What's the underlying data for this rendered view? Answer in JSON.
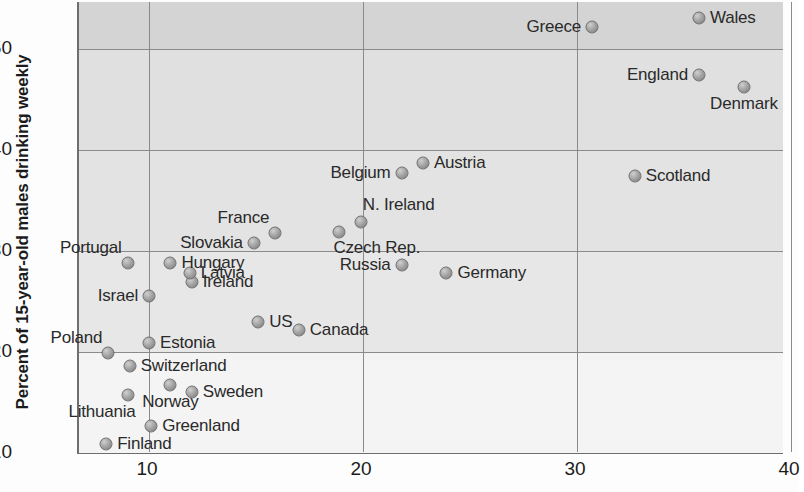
{
  "chart_data": {
    "type": "scatter",
    "title": "",
    "xlabel": "",
    "ylabel": "Percent of 15-year-old males drinking weekly",
    "xlim": [
      7,
      40
    ],
    "ylim": [
      10,
      55
    ],
    "xticks": [
      10,
      20,
      30,
      40
    ],
    "yticks": [
      10,
      20,
      30,
      40,
      50
    ],
    "grid": true,
    "legend": "none",
    "marker_color": "#9a9a9a",
    "marker_edge_color": "#6b6b6b",
    "points": [
      {
        "label": "Finland",
        "x": 8.0,
        "y": 10.9,
        "pos": "r"
      },
      {
        "label": "Greenland",
        "x": 10.1,
        "y": 12.7,
        "pos": "r"
      },
      {
        "label": "Lithuania",
        "x": 9.0,
        "y": 15.7,
        "pos": "bl"
      },
      {
        "label": "Norway",
        "x": 11.0,
        "y": 16.7,
        "pos": "b"
      },
      {
        "label": "Sweden",
        "x": 12.0,
        "y": 16.0,
        "pos": "r"
      },
      {
        "label": "Switzerland",
        "x": 9.1,
        "y": 18.6,
        "pos": "r"
      },
      {
        "label": "Poland",
        "x": 8.1,
        "y": 19.9,
        "pos": "tl"
      },
      {
        "label": "Estonia",
        "x": 10.0,
        "y": 20.9,
        "pos": "r"
      },
      {
        "label": "Canada",
        "x": 17.0,
        "y": 22.2,
        "pos": "r"
      },
      {
        "label": "US",
        "x": 15.1,
        "y": 23.0,
        "pos": "r"
      },
      {
        "label": "Israel",
        "x": 10.0,
        "y": 25.5,
        "pos": "l"
      },
      {
        "label": "Ireland",
        "x": 12.0,
        "y": 26.9,
        "pos": "r"
      },
      {
        "label": "Latvia",
        "x": 11.9,
        "y": 27.8,
        "pos": "r"
      },
      {
        "label": "Portugal",
        "x": 9.0,
        "y": 28.8,
        "pos": "tl"
      },
      {
        "label": "Hungary",
        "x": 11.0,
        "y": 28.8,
        "pos": "r"
      },
      {
        "label": "Germany",
        "x": 23.9,
        "y": 27.8,
        "pos": "r"
      },
      {
        "label": "Russia",
        "x": 21.8,
        "y": 28.6,
        "pos": "l"
      },
      {
        "label": "Slovakia",
        "x": 14.9,
        "y": 30.8,
        "pos": "l"
      },
      {
        "label": "France",
        "x": 15.9,
        "y": 31.8,
        "pos": "tl"
      },
      {
        "label": "Czech Rep.",
        "x": 18.9,
        "y": 31.9,
        "pos": "br"
      },
      {
        "label": "N. Ireland",
        "x": 19.9,
        "y": 32.9,
        "pos": "tr"
      },
      {
        "label": "Belgium",
        "x": 21.8,
        "y": 37.7,
        "pos": "l"
      },
      {
        "label": "Austria",
        "x": 22.8,
        "y": 38.7,
        "pos": "r"
      },
      {
        "label": "Scotland",
        "x": 32.7,
        "y": 37.4,
        "pos": "r"
      },
      {
        "label": "Denmark",
        "x": 37.8,
        "y": 46.2,
        "pos": "b"
      },
      {
        "label": "England",
        "x": 35.7,
        "y": 47.4,
        "pos": "l"
      },
      {
        "label": "Greece",
        "x": 30.7,
        "y": 52.2,
        "pos": "l"
      },
      {
        "label": "Wales",
        "x": 35.7,
        "y": 53.1,
        "pos": "r"
      }
    ]
  },
  "axis": {
    "y_title": "Percent of 15-year-old males drinking weekly",
    "y_tick_labels": [
      "10",
      "20",
      "30",
      "40",
      "50"
    ],
    "x_tick_labels": [
      "10",
      "20",
      "30",
      "40"
    ]
  }
}
